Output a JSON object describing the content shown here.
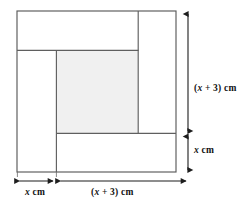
{
  "figure": {
    "type": "geometry-diagram",
    "colors": {
      "stroke": "#4a4a4a",
      "stroke_dark": "#2b2b2b",
      "shaded_fill": "#f0f0f0",
      "background": "#ffffff",
      "text": "#111111"
    },
    "outer_square": {
      "left": 17,
      "top": 11,
      "right": 176,
      "bottom": 172
    },
    "interior_lines": {
      "top_band_bottom_y": 50,
      "left_band_right_x": 56,
      "inner_right_x": 138,
      "inner_bottom_y": 133
    },
    "shaded_square": {
      "left": 56,
      "top": 50,
      "right": 138,
      "bottom": 133
    }
  },
  "dimensions": {
    "right_height": {
      "value_plain": "(x + 3) cm",
      "prefix": "(",
      "variable": "x",
      "suffix": " + 3) cm",
      "arrow_x": 188,
      "arrow_top": 13,
      "arrow_bottom": 133
    },
    "right_x": {
      "value_plain": "x cm",
      "variable": "x",
      "suffix": " cm",
      "arrow_x": 188,
      "arrow_top": 135,
      "arrow_bottom": 172
    },
    "bottom_x": {
      "value_plain": "x cm",
      "variable": "x",
      "suffix": " cm",
      "arrow_y": 181,
      "arrow_left": 18,
      "arrow_right": 54
    },
    "bottom_width": {
      "value_plain": "(x + 3) cm",
      "prefix": "(",
      "variable": "x",
      "suffix": " + 3) cm",
      "arrow_y": 181,
      "arrow_left": 59,
      "arrow_right": 188
    }
  }
}
